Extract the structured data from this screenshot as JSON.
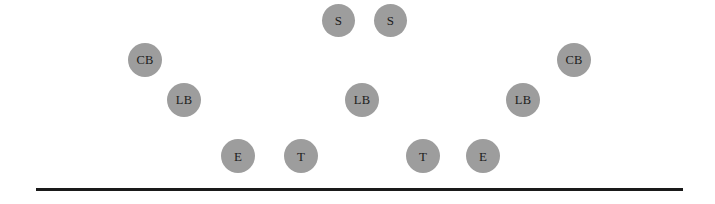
{
  "diagram": {
    "scheme": "4-3 Defense",
    "background_color": "#ffffff",
    "marker_fill_color": "#9d9d9d",
    "marker_text_color": "#1c1c1c",
    "line_color": "#1a1a1a"
  },
  "line_of_scrimmage": {
    "name": "line-of-scrimmage",
    "x": 36,
    "y": 188,
    "width": 647,
    "height": 3
  },
  "players": [
    {
      "id": "safety-left",
      "label": "S",
      "position_group": "Safety",
      "x": 322,
      "y": 4,
      "size": 33
    },
    {
      "id": "safety-right",
      "label": "S",
      "position_group": "Safety",
      "x": 374,
      "y": 4,
      "size": 33
    },
    {
      "id": "cornerback-left",
      "label": "CB",
      "position_group": "Cornerback",
      "x": 128,
      "y": 43,
      "size": 34
    },
    {
      "id": "cornerback-right",
      "label": "CB",
      "position_group": "Cornerback",
      "x": 557,
      "y": 43,
      "size": 34
    },
    {
      "id": "linebacker-left",
      "label": "LB",
      "position_group": "Linebacker",
      "x": 167,
      "y": 83,
      "size": 34
    },
    {
      "id": "linebacker-middle",
      "label": "LB",
      "position_group": "Linebacker",
      "x": 345,
      "y": 83,
      "size": 34
    },
    {
      "id": "linebacker-right",
      "label": "LB",
      "position_group": "Linebacker",
      "x": 506,
      "y": 83,
      "size": 34
    },
    {
      "id": "end-left",
      "label": "E",
      "position_group": "Defensive End",
      "x": 221,
      "y": 139,
      "size": 34
    },
    {
      "id": "tackle-left",
      "label": "T",
      "position_group": "Defensive Tackle",
      "x": 284,
      "y": 139,
      "size": 34
    },
    {
      "id": "tackle-right",
      "label": "T",
      "position_group": "Defensive Tackle",
      "x": 406,
      "y": 139,
      "size": 34
    },
    {
      "id": "end-right",
      "label": "E",
      "position_group": "Defensive End",
      "x": 466,
      "y": 139,
      "size": 34
    }
  ]
}
